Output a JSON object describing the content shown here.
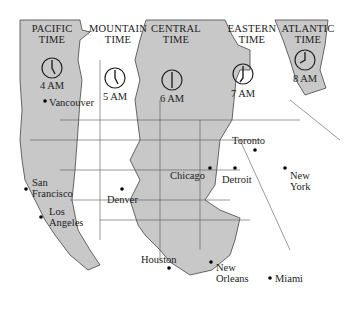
{
  "colors": {
    "zone_shaded": "#c8c8c8",
    "zone_white": "#ffffff",
    "border": "#444444",
    "text": "#222222"
  },
  "zones": [
    {
      "name": "PACIFIC",
      "sub": "TIME",
      "time": "4 AM",
      "shaded": true
    },
    {
      "name": "MOUNTAIN",
      "sub": "TIME",
      "time": "5 AM",
      "shaded": false
    },
    {
      "name": "CENTRAL",
      "sub": "TIME",
      "time": "6 AM",
      "shaded": true
    },
    {
      "name": "EASTERN",
      "sub": "TIME",
      "time": "7 AM",
      "shaded": false
    },
    {
      "name": "ATLANTIC",
      "sub": "TIME",
      "time": "8 AM",
      "shaded": true
    }
  ],
  "cities": [
    {
      "name": "Vancouver"
    },
    {
      "name": "San\nFrancisco"
    },
    {
      "name": "Los\nAngeles"
    },
    {
      "name": "Denver"
    },
    {
      "name": "Chicago"
    },
    {
      "name": "Toronto"
    },
    {
      "name": "Detroit"
    },
    {
      "name": "New\nYork"
    },
    {
      "name": "Houston"
    },
    {
      "name": "New\nOrleans"
    },
    {
      "name": "Miami"
    }
  ]
}
